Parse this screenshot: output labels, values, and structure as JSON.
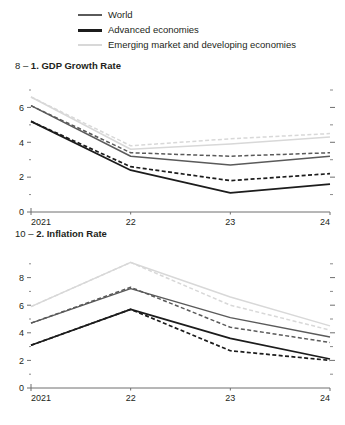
{
  "legend": {
    "items": [
      {
        "label": "World",
        "style": "solid",
        "color": "#5a5a5a",
        "key": "world"
      },
      {
        "label": "Advanced economies",
        "style": "solid",
        "color": "#1c1c1c",
        "key": "adv"
      },
      {
        "label": "Emerging market and developing economies",
        "style": "solid",
        "color": "#d8d8d8",
        "key": "emde"
      }
    ]
  },
  "panels": [
    {
      "number": "8 – ",
      "title": "1. GDP Growth Rate"
    },
    {
      "number": "10 – ",
      "title": "2. Inflation Rate"
    }
  ],
  "chart_data": [
    {
      "type": "line",
      "title": "1. GDP Growth Rate",
      "panel_number": "8 – ",
      "xlabel": "",
      "ylabel": "",
      "x": [
        "2021",
        "22",
        "23",
        "24"
      ],
      "xtick_labels": [
        "2021",
        "22",
        "23",
        "24"
      ],
      "ylim": [
        0,
        7
      ],
      "yticks": [
        0,
        2,
        4,
        6
      ],
      "ytick_labels": [
        "0",
        "2",
        "4",
        "6"
      ],
      "minor_yticks": [
        1,
        3,
        5,
        7
      ],
      "grid": false,
      "legend_position": "top",
      "series": [
        {
          "name": "World",
          "style": "solid",
          "color": "#5a5a5a",
          "values": [
            6.1,
            3.2,
            2.7,
            3.2
          ]
        },
        {
          "name": "World (previous projection)",
          "style": "dashed",
          "color": "#5a5a5a",
          "values": [
            6.1,
            3.4,
            3.2,
            3.4
          ]
        },
        {
          "name": "Advanced economies",
          "style": "solid",
          "color": "#1c1c1c",
          "values": [
            5.2,
            2.4,
            1.1,
            1.6
          ]
        },
        {
          "name": "Advanced economies (previous projection)",
          "style": "dashed",
          "color": "#1c1c1c",
          "values": [
            5.2,
            2.6,
            1.8,
            2.2
          ]
        },
        {
          "name": "Emerging market and developing economies",
          "style": "solid",
          "color": "#d8d8d8",
          "values": [
            6.6,
            3.6,
            3.9,
            4.3
          ]
        },
        {
          "name": "Emerging market and developing economies (previous projection)",
          "style": "dashed",
          "color": "#d8d8d8",
          "values": [
            6.6,
            3.8,
            4.2,
            4.5
          ]
        }
      ]
    },
    {
      "type": "line",
      "title": "2. Inflation Rate",
      "panel_number": "10 – ",
      "xlabel": "",
      "ylabel": "",
      "x": [
        "2021",
        "22",
        "23",
        "24"
      ],
      "xtick_labels": [
        "2021",
        "22",
        "23",
        "24"
      ],
      "ylim": [
        0,
        10
      ],
      "yticks": [
        0,
        2,
        4,
        6,
        8
      ],
      "ytick_labels": [
        "0",
        "2",
        "4",
        "6",
        "8"
      ],
      "minor_yticks": [
        1,
        3,
        5,
        7,
        9
      ],
      "grid": false,
      "legend_position": "top",
      "series": [
        {
          "name": "World",
          "style": "solid",
          "color": "#5a5a5a",
          "values": [
            4.7,
            7.2,
            5.1,
            3.7
          ]
        },
        {
          "name": "World (previous projection)",
          "style": "dashed",
          "color": "#5a5a5a",
          "values": [
            4.7,
            7.3,
            4.4,
            3.3
          ]
        },
        {
          "name": "Advanced economies",
          "style": "solid",
          "color": "#1c1c1c",
          "values": [
            3.1,
            5.7,
            3.6,
            2.1
          ]
        },
        {
          "name": "Advanced economies (previous projection)",
          "style": "dashed",
          "color": "#1c1c1c",
          "values": [
            3.1,
            5.7,
            2.7,
            2.0
          ]
        },
        {
          "name": "Emerging market and developing economies",
          "style": "solid",
          "color": "#d8d8d8",
          "values": [
            5.9,
            9.1,
            6.6,
            4.5
          ]
        },
        {
          "name": "Emerging market and developing economies (previous projection)",
          "style": "dashed",
          "color": "#d8d8d8",
          "values": [
            5.9,
            9.1,
            6.0,
            4.2
          ]
        }
      ]
    }
  ]
}
